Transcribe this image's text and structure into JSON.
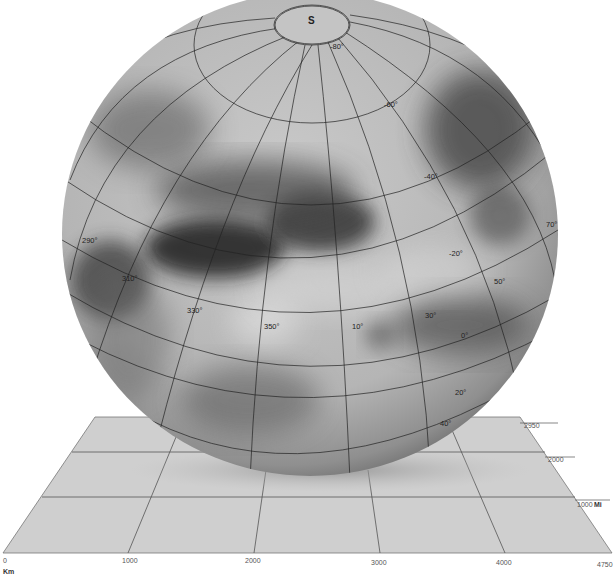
{
  "map": {
    "pole_label": "S",
    "latitude_labels": [
      {
        "text": "-80°",
        "x": 330,
        "y": 49
      },
      {
        "text": "-60°",
        "x": 384,
        "y": 107
      },
      {
        "text": "-40°",
        "x": 424,
        "y": 179
      },
      {
        "text": "-20°",
        "x": 449,
        "y": 256
      },
      {
        "text": "0°",
        "x": 461,
        "y": 338
      },
      {
        "text": "20°",
        "x": 455,
        "y": 395
      },
      {
        "text": "40°",
        "x": 440,
        "y": 426
      }
    ],
    "longitude_labels": [
      {
        "text": "290°",
        "x": 82,
        "y": 243
      },
      {
        "text": "310°",
        "x": 122,
        "y": 281
      },
      {
        "text": "330°",
        "x": 187,
        "y": 313
      },
      {
        "text": "350°",
        "x": 264,
        "y": 329
      },
      {
        "text": "10°",
        "x": 352,
        "y": 329
      },
      {
        "text": "30°",
        "x": 425,
        "y": 318
      },
      {
        "text": "50°",
        "x": 494,
        "y": 284
      },
      {
        "text": "70°",
        "x": 546,
        "y": 227
      }
    ]
  },
  "scale": {
    "km_ticks": [
      {
        "text": "0",
        "x": 3,
        "y": 563
      },
      {
        "text": "1000",
        "x": 122,
        "y": 563
      },
      {
        "text": "2000",
        "x": 245,
        "y": 563
      },
      {
        "text": "3000",
        "x": 371,
        "y": 565
      },
      {
        "text": "4000",
        "x": 496,
        "y": 565
      },
      {
        "text": "4750",
        "x": 597,
        "y": 567
      }
    ],
    "km_unit": "Km",
    "mi_ticks": [
      {
        "text": "2950",
        "x": 524,
        "y": 428
      },
      {
        "text": "2000",
        "x": 548,
        "y": 462
      },
      {
        "text": "1000",
        "x": 577,
        "y": 507
      }
    ],
    "mi_unit": "Mi"
  }
}
